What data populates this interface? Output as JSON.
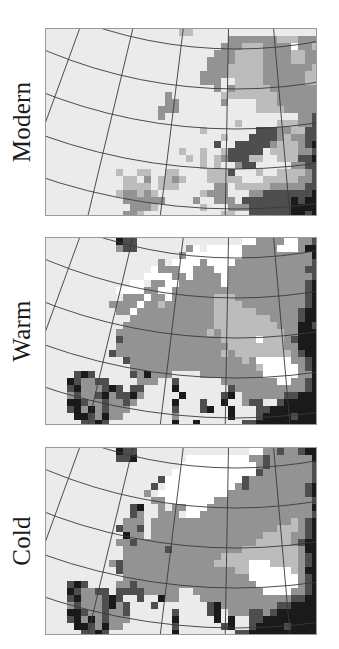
{
  "figure": {
    "panels": [
      {
        "id": "modern",
        "label": "Modern",
        "top": 28,
        "rows": [
          "...................ll.................",
          "..........................mmmmmmmlllmmm",
          ".........................mmmlllmmmmwmml",
          "........................mmmllllmmmmllmm",
          ".......................mmmmllllmmmmllmm",
          ".......................mmmlllllmmmmmmml",
          "......................mmmmlllllmmmmmmll",
          "......................mmm..llllmmmmmmll",
          "........................m.mlllllmmmmmmml",
          ".................m.......llllllllmmmmmm",
          ".................mm......m....lllmmmmmm",
          "................mmm...........llllmmmmm",
          "................m...................mmd",
          "...........................l.....lllmmd",
          "......................l.......dddmmlldd",
          ".........................l...ddddmlmmdd",
          "........................d..dddddmlllmdk",
          "...................l..l..lddddd.llllmmd",
          "....................l.l.lmdddll..lllddk",
          "......................l.l..mdd.....mmdd",
          "..........l..ll..ll....llld...l..llllmd",
          "...........ll.m.llml...lllll...lllllmmd",
          "...........llll.lll.....mm.lllllmmmmmdd",
          "..........lmmlml......lmmm...mmdddddddk",
          "...........mmmmmm....m..mmm.dddddddkdkk",
          "............mmml......l...mmmddddddkkkk",
          "...........mml...........ll..ddddddkkdk"
        ]
      },
      {
        "id": "warm",
        "label": "Warm",
        "top": 237,
        "rows": [
          "..........kdd...............wwmmmmwwmmd",
          "..........mdd.......mw.wwwwwmmmmmwwwmkk",
          "...................mwwwwwwwwmmmmmmmmmmk",
          "................m.wwwwmwwwwmmmmmmmmmmmd",
          "...............wmmmwwmmmwwmmmmmmmmmmmdd",
          "..............wwwwmmwmmmmwmmmmmmmmmmmmd",
          "............ww.mmwwmmmmmmwmmmmmmmmmmmdk",
          "..........wwwwmmwwmmmmmmmmmmmmmmmmmmmdk",
          "...........mmmwmmwmmmmmmlllmmmmmmmmmmdk",
          ".........mmmmwmmlmmmmmmmllllmmmmmmmmmdk",
          "..........mmwmmmmmmmmmmmllllllmmmmmmdkk",
          "............mmmmmmmmmmmmllllllllmmmmdkk",
          "...........mmmmmmmmmmmmmlllllllllmmmkkd",
          "..........mmmmmmmmmmmmmlmlllllllllmmkkk",
          "..........dmmmmmmmmmmmmmmlllllwlllmdkkk",
          "..........mmmmmmmmmmmmmmmmllllllllmmkkk",
          ".........dmmmmmmmmmmmmmmmlmllllllllmdkk",
          "...........dmmmmmmmmmmmmmmmmlmwwwwwmmdk",
          "............mmmmmmmmmmmmmmmmmmlwwwwwmdk",
          "....dkd.....dmkmmm....mmmmmmmmmwwwwwmmk",
          "...kdmmdd....mmm..d......mmmmmmmmwwmmdk",
          "...dkmmmdkd.dd....k.......dmmmmmmmmmmdk",
          "...mdmmdkmddkm.....k.....dk.mmmmmmddkkk",
          "...kkdmmdmmdm.....k...d..k..mdd..dkkkkk",
          "...dkmkmdmmm......d...dk..k...ddkkkkkkk",
          "....kkdmkmm.......m.......k...dkkkkdkkk",
          ".....ddkd.........k..k......ddkkkkkkkkk"
        ]
      },
      {
        "id": "cold",
        "label": "Cold",
        "top": 447,
        "rows": [
          "..........kdd................wwmmdmmdkk",
          "..........ddk.......wwwwwwwwwmmdmmmmmmk",
          "...................wwwwwwwwwwwmdmmmmmmd",
          "..................wwwwwwwwwwwwdmmmmmmmd",
          "................dwwwwwwwwwwwdmmmmmmmmmd",
          "...............d.wwwwwwwwwwmdmmmmmmmmdk",
          "..............m.wwwwwwwwwwmmmmmmmmmmmdk",
          "...............mmwwwwwwwmmmmmmmmmmmmmmd",
          "............dk..m.mmwwwmmmmmmmmmmmmmmmk",
          "............dm..mmm.wwmmmmmmmmmmmmmmmmd",
          "...........mmm.mmmmmmmmmmmmmmmmmmmmlmdk",
          "..........dmmd.mmmmmmmmmmmmmmmmmmlllmdk",
          "...........kmm.mmmmmmmmmmmmmmmmllllmmdk",
          "..........mmdmmmmmmmmmmmmmmmmmlllllmdkk",
          "...........mmmmmmdmmmmmmmmmmllllllllmkk",
          "...........mmmmmmmmmmmmmmlllllllllllmdk",
          ".........mdmmmmmmmmmmmmmlllllwwwllllmdk",
          "..........dmmmmmmmmmmmmmmmmllwwwwwwlmkk",
          "...........mmmmmmmmmmmmmmmmmmwwwwwwwmdk",
          "...dkd....mmdmmmmmmmmmmmmmmmmmwwwwwwmdk",
          "...kdmmdd.ddddmmmmm..mmmmmmmmmmwwwwmmdk",
          "...dkmmmdkd..d..kmm...mmmmmmmmmmmmmddkk",
          "...mdmmmdkmd...d.......dkmmmmmmmmddkkkk",
          "...kkdmmdmmd......d....dk.mmmddmdkkkkkk",
          "...dkmkmdmmm......k.....k.k..ddkkkkkkkk",
          "....kkdmkmm.......d......dk..dkkkkdkkkk",
          ".....ddkd.........k........ddkkkkkkkkkk"
        ]
      }
    ],
    "palette": {
      "background": "#ebebeb",
      "white": "#ffffff",
      "light": "#bcbcbc",
      "mid": "#939393",
      "dark": "#4e4e4e",
      "black": "#1a1a1a",
      "graticule": "#3a3a3a",
      "frame": "#9a9a9a"
    }
  }
}
